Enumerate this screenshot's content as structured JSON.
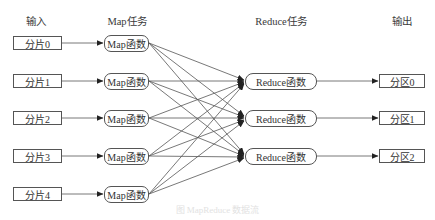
{
  "diagram": {
    "title_caption": "图 MapReduce 数据流",
    "columns": {
      "input": "输入",
      "map": "Map任务",
      "reduce": "Reduce任务",
      "output": "输出"
    },
    "inputs": [
      {
        "label": "分片0"
      },
      {
        "label": "分片1"
      },
      {
        "label": "分片2"
      },
      {
        "label": "分片3"
      },
      {
        "label": "分片4"
      }
    ],
    "maps": [
      {
        "label": "Map函数"
      },
      {
        "label": "Map函数"
      },
      {
        "label": "Map函数"
      },
      {
        "label": "Map函数"
      },
      {
        "label": "Map函数"
      }
    ],
    "reduces": [
      {
        "label": "Reduce函数"
      },
      {
        "label": "Reduce函数"
      },
      {
        "label": "Reduce函数"
      }
    ],
    "outputs": [
      {
        "label": "分区0"
      },
      {
        "label": "分区1"
      },
      {
        "label": "分区2"
      }
    ],
    "edges": {
      "input_to_map": "one-to-one",
      "map_to_reduce": "all-to-all (shuffle)",
      "reduce_to_output": "one-to-one"
    },
    "colors": {
      "stroke": "#555555",
      "text": "#333333",
      "background": "#ffffff"
    }
  }
}
